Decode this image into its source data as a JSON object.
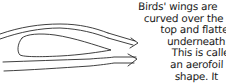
{
  "diagram": {
    "elements": [
      "wing-cross-section",
      "airflow-line-top-outer",
      "airflow-line-top-inner",
      "airflow-line-bottom-upper",
      "airflow-line-bottom-lower",
      "arrow-upper",
      "arrow-lower"
    ],
    "stroke_color": "#2a2a2a"
  },
  "caption": {
    "lines": [
      {
        "text": "Birds' wings are",
        "indent": 0
      },
      {
        "text": "curved over the",
        "indent": 6
      },
      {
        "text": "top and flatter",
        "indent": 23
      },
      {
        "text": "underneath.",
        "indent": 30
      },
      {
        "text": "This is called",
        "indent": 35
      },
      {
        "text": "an aerofoil",
        "indent": 34
      },
      {
        "text": "shape. It",
        "indent": 39
      }
    ]
  }
}
